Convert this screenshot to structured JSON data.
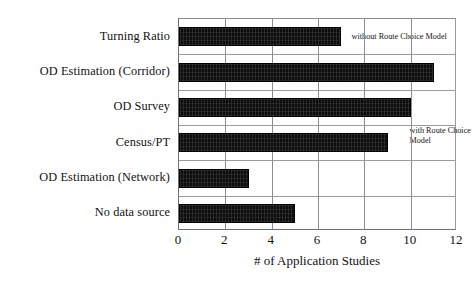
{
  "chart_data": {
    "type": "bar",
    "orientation": "horizontal",
    "title": "",
    "xlabel": "# of Application Studies",
    "ylabel": "",
    "categories": [
      "Turning Ratio",
      "OD Estimation (Corridor)",
      "OD Survey",
      "Census/PT",
      "OD Estimation (Network)",
      "No data source"
    ],
    "values": [
      7,
      11,
      10,
      9,
      3,
      5
    ],
    "xlim": [
      0,
      12
    ],
    "xticks": [
      "0",
      "2",
      "4",
      "6",
      "8",
      "10",
      "12"
    ],
    "xtick_values": [
      0,
      2,
      4,
      6,
      8,
      10,
      12
    ],
    "grid": "vertical-and-horizontal",
    "legend": "none",
    "bar_color": "#0d0d0d",
    "annotations": [
      {
        "text": "without Route Choice Model",
        "x_value": 7.45,
        "category_index": 0
      },
      {
        "text": "with Route Choice Model",
        "x_value": 9.95,
        "category_index": 3
      }
    ]
  }
}
